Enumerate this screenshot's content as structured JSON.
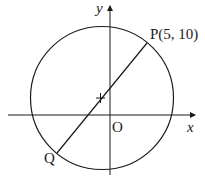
{
  "diagram": {
    "type": "geometry-circle-with-diameter",
    "labels": {
      "x_axis": "x",
      "y_axis": "y",
      "origin": "O",
      "point_p": "P(5, 10)",
      "point_q": "Q"
    },
    "elements": {
      "circle": {
        "description": "circle with center marked by a cross, passing through P and Q"
      },
      "diameter": {
        "from": "P",
        "to": "Q",
        "through": "center"
      },
      "center_mark": "+"
    },
    "colors": {
      "stroke": "#1a1a1a",
      "background": "#ffffff"
    }
  }
}
